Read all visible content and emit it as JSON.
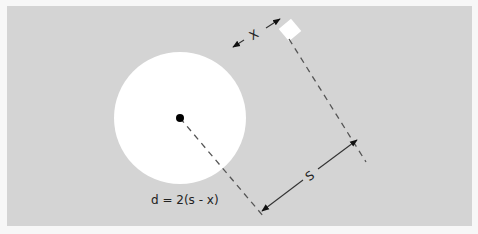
{
  "diagram": {
    "panel_color": "#d4d4d4",
    "circle_color": "#ffffff",
    "dot_color": "#000000",
    "line_color": "#555555",
    "labels": {
      "x": "X",
      "s": "S",
      "formula": "d = 2(s - x)"
    }
  }
}
